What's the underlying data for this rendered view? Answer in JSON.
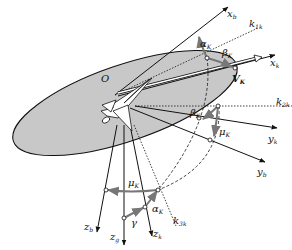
{
  "colors": {
    "background": "#ffffff",
    "plane_fill": "#c8c8c8",
    "stroke": "#111111",
    "angle_arrow": "#777777",
    "aircraft_fill": "#ffffff"
  },
  "labels": {
    "origin": "O",
    "xb": {
      "base": "x",
      "sub": "b"
    },
    "xk": {
      "base": "x",
      "sub": "k"
    },
    "yb": {
      "base": "y",
      "sub": "b"
    },
    "yk": {
      "base": "y",
      "sub": "k"
    },
    "zb": {
      "base": "z",
      "sub": "b"
    },
    "zk": {
      "base": "z",
      "sub": "k"
    },
    "zg": {
      "base": "z",
      "sub": "g"
    },
    "k1k": {
      "base": "k",
      "sub": "1k"
    },
    "k2k": {
      "base": "k",
      "sub": "2k"
    },
    "k3k": {
      "base": "k",
      "sub": "3k"
    },
    "velocity": {
      "base": "V",
      "sub": "K"
    },
    "alpha_top": {
      "base": "α",
      "sub": "K"
    },
    "alpha_bottom": {
      "base": "α",
      "sub": "K"
    },
    "beta_top": {
      "base": "β",
      "sub": "K"
    },
    "beta_mid": {
      "base": "β",
      "sub": "K"
    },
    "mu_right": {
      "base": "μ",
      "sub": "K"
    },
    "mu_bottom": {
      "base": "μ",
      "sub": "K"
    },
    "gamma": {
      "base": "γ",
      "sub": ""
    }
  }
}
